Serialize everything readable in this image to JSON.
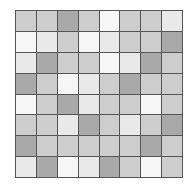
{
  "board": {
    "rows": 8,
    "cols": 8,
    "palette": {
      "0": "#f6f6f6",
      "1": "#e9e9e9",
      "2": "#cdcdcd",
      "3": "#a9a9a9"
    },
    "border_color": "#555555",
    "cells": [
      [
        2,
        2,
        3,
        2,
        0,
        2,
        2,
        1
      ],
      [
        0,
        1,
        2,
        0,
        1,
        2,
        2,
        3
      ],
      [
        1,
        3,
        2,
        2,
        0,
        1,
        3,
        2
      ],
      [
        3,
        2,
        0,
        1,
        2,
        3,
        2,
        2
      ],
      [
        0,
        2,
        3,
        1,
        2,
        2,
        0,
        2
      ],
      [
        2,
        2,
        1,
        3,
        2,
        1,
        2,
        3
      ],
      [
        3,
        2,
        2,
        2,
        2,
        2,
        3,
        2
      ],
      [
        1,
        3,
        0,
        1,
        3,
        2,
        0,
        2
      ]
    ]
  }
}
